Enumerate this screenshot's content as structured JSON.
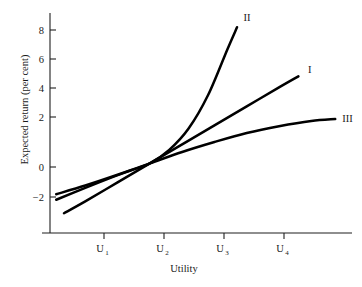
{
  "chart_data": {
    "type": "line",
    "title": "",
    "xlabel": "Utility",
    "ylabel": "Expected return (per cent)",
    "grid": false,
    "legend_position": "inline-right-end-of-curve",
    "x_tick_labels": [
      "U",
      "U",
      "U",
      "U"
    ],
    "x_tick_subscripts": [
      "1",
      "2",
      "3",
      "4"
    ],
    "x_tick_values": [
      1,
      2,
      3,
      4
    ],
    "xlim": [
      0.33,
      5.13
    ],
    "y_tick_labels": [
      "8",
      "6",
      "4",
      "2",
      "0",
      "−2"
    ],
    "y_tick_values": [
      8,
      6,
      4,
      2,
      0,
      -2
    ],
    "ylim": [
      -4.4,
      9.5
    ],
    "series": [
      {
        "name": "I",
        "label": "I",
        "shape": "straight-line",
        "x": [
          0.67,
          1.0,
          1.5,
          2.0,
          2.5,
          3.0,
          3.5,
          4.0,
          4.3
        ],
        "y": [
          -3.15,
          -2.4,
          -1.2,
          0.0,
          1.2,
          2.4,
          3.6,
          4.8,
          5.5
        ],
        "label_x": 4.45,
        "label_y": 5.9
      },
      {
        "name": "II",
        "label": "II",
        "shape": "convex-increasing",
        "x": [
          0.55,
          1.0,
          1.4,
          1.7,
          2.0,
          2.3,
          2.6,
          2.9,
          3.2,
          3.35
        ],
        "y": [
          -2.3,
          -1.55,
          -0.9,
          -0.45,
          0.0,
          0.85,
          2.2,
          4.3,
          7.2,
          8.6
        ],
        "label_x": 3.45,
        "label_y": 9.2
      },
      {
        "name": "III",
        "label": "III",
        "shape": "concave-increasing",
        "x": [
          0.55,
          1.0,
          1.5,
          2.0,
          2.5,
          3.0,
          3.5,
          4.0,
          4.5,
          4.87
        ],
        "y": [
          -1.95,
          -1.4,
          -0.72,
          0.0,
          0.72,
          1.35,
          1.92,
          2.35,
          2.68,
          2.8
        ],
        "label_x": 4.98,
        "label_y": 2.82
      }
    ],
    "intersection_point": {
      "x": 2,
      "y": 0,
      "note": "all three curves pass through (U2, 0)"
    }
  },
  "axes": {
    "y_axis_label": "Expected return (per cent)",
    "x_axis_label": "Utility"
  },
  "labels": {
    "curve_one": "I",
    "curve_two": "II",
    "curve_three": "III"
  },
  "colors": {
    "curve": "#000000",
    "axis": "#1f1f1f",
    "background": "#ffffff",
    "text": "#1a1a1a"
  }
}
